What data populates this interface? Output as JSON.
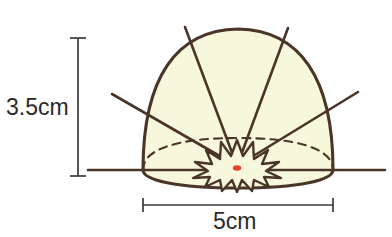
{
  "figure": {
    "shape_name": "hemisphere-dome",
    "colors": {
      "outline": "#4A3528",
      "fill": "#F7F7DC",
      "ray": "#4A3528",
      "dashed_edge": "#4A3528",
      "burst_outline": "#4A3528",
      "center_dot": "#E8402A",
      "dimension_line": "#3A3A3A",
      "label_text": "#2B2B2B",
      "background": "#FFFFFF"
    }
  },
  "dimensions": {
    "height": {
      "value": "3.5cm",
      "number": 3.5,
      "unit": "cm",
      "orientation": "vertical",
      "measures": "dome-height"
    },
    "width": {
      "value": "5cm",
      "number": 5,
      "unit": "cm",
      "orientation": "horizontal",
      "measures": "dome-base-diameter"
    }
  },
  "elements": {
    "dome": {
      "name": "hemisphere-dome",
      "left_x": 143,
      "right_x": 333,
      "apex_y": 30,
      "base_y": 170,
      "front_bottom_y": 188
    },
    "base_line": {
      "name": "horizontal-base-line",
      "start_x": 88,
      "end_x": 385,
      "y": 170
    },
    "hidden_edge": {
      "name": "dashed-back-ellipse-edge",
      "style": "dashed",
      "peak_y": 138
    },
    "center_burst": {
      "name": "center-burst-star",
      "center_x": 237,
      "center_y": 168,
      "points": 9
    },
    "center_dot": {
      "name": "center-point-dot",
      "center_x": 237,
      "center_y": 168,
      "radius_x": 4,
      "radius_y": 2.6
    },
    "rays": [
      {
        "id": "ray-upper-left",
        "tip_x": 185,
        "tip_y": 27
      },
      {
        "id": "ray-upper-right",
        "tip_x": 288,
        "tip_y": 28
      },
      {
        "id": "ray-lower-left",
        "tip_x": 112,
        "tip_y": 94
      },
      {
        "id": "ray-lower-right",
        "tip_x": 358,
        "tip_y": 92
      }
    ]
  }
}
